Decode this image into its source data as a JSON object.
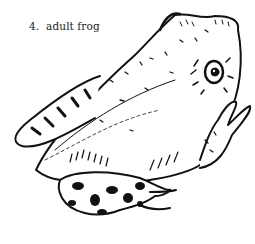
{
  "illustration": {
    "caption": "4.  adult frog",
    "subject": "adult frog",
    "style": "black ink line drawing with hatching and spotted legs",
    "colors": {
      "ink": "#111111",
      "background": "#ffffff",
      "caption": "#222222"
    }
  }
}
